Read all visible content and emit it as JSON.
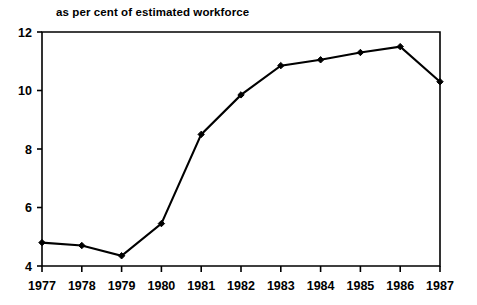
{
  "chart_data": {
    "type": "line",
    "title": "",
    "subtitle": "as per cent of estimated workforce",
    "xlabel": "",
    "ylabel": "",
    "categories": [
      "1977",
      "1978",
      "1979",
      "1980",
      "1981",
      "1982",
      "1983",
      "1984",
      "1985",
      "1986",
      "1987"
    ],
    "values": [
      4.8,
      4.7,
      4.35,
      5.45,
      8.5,
      9.85,
      10.85,
      11.05,
      11.3,
      11.5,
      10.3
    ],
    "x": [
      1977,
      1978,
      1979,
      1980,
      1981,
      1982,
      1983,
      1984,
      1985,
      1986,
      1987
    ],
    "ylim": [
      4,
      12
    ],
    "yticks": [
      "4",
      "6",
      "8",
      "10",
      "12"
    ],
    "ytick_values": [
      4,
      6,
      8,
      10,
      12
    ],
    "xlim": [
      1977,
      1987
    ],
    "grid": false,
    "legend": false,
    "legend_position": "none",
    "series": [
      {
        "name": "unemployment rate",
        "color": "#000000",
        "marker": "filled-diamond",
        "values": [
          4.8,
          4.7,
          4.35,
          5.45,
          8.5,
          9.85,
          10.85,
          11.05,
          11.3,
          11.5,
          10.3
        ]
      }
    ],
    "annotations": []
  },
  "axes": {
    "top_border": true,
    "right_border": true,
    "left_border": true,
    "bottom_border": true
  },
  "colors": {
    "background": "#ffffff",
    "ink": "#000000",
    "line": "#000000"
  }
}
